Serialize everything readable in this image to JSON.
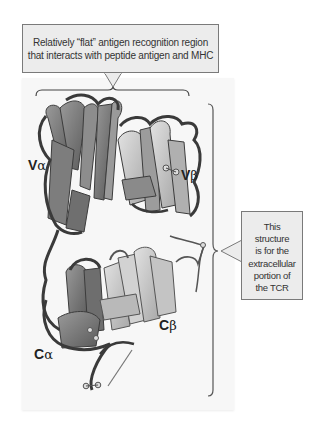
{
  "figure": {
    "callouts": {
      "top": {
        "line1": "Relatively “flat” antigen recognition region",
        "line2": "that interacts with peptide antigen and MHC"
      },
      "right": {
        "lines": [
          "This",
          "structure",
          "is for the",
          "extracellular",
          "portion of",
          "the TCR"
        ]
      }
    },
    "labels": {
      "v_alpha": {
        "letter": "V",
        "greek": "α"
      },
      "v_beta": {
        "letter": "V",
        "greek": "β"
      },
      "c_alpha": {
        "letter": "C",
        "greek": "α"
      },
      "c_beta": {
        "letter": "C",
        "greek": "β"
      }
    },
    "colors": {
      "callout_fill": "#ececec",
      "callout_border": "#7a7a7a",
      "panel_fill": "#f7f7f7",
      "ribbon_dark": "#4a4a4a",
      "ribbon_mid": "#8a8a8a",
      "ribbon_light": "#c8c8c8"
    }
  }
}
